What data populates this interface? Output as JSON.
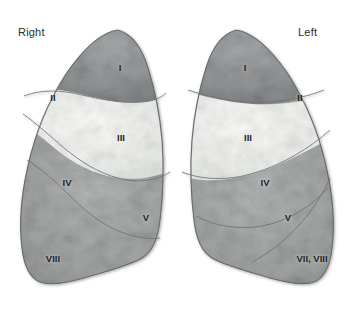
{
  "figure": {
    "width": 354,
    "height": 311,
    "background": "#ffffff"
  },
  "orientation_labels": {
    "right": "Right",
    "left": "Left"
  },
  "colors": {
    "background": "#ffffff",
    "lung_dark": "#8e9193",
    "lung_mid": "#9fa2a3",
    "lung_light": "#e6e8e6",
    "lung_pale": "#f0f1ef",
    "outline": "#6a6d6f",
    "label_text": "#1d1d1d",
    "side_label_text": "#2b2b2b"
  },
  "right_lung": {
    "name": "right-lung",
    "segments": [
      {
        "id": "r1",
        "label": "I",
        "x": 120,
        "y": 67,
        "shade": "dark"
      },
      {
        "id": "r2",
        "label": "II",
        "x": 53,
        "y": 97,
        "shade": "dark"
      },
      {
        "id": "r3",
        "label": "III",
        "x": 121,
        "y": 137,
        "shade": "light"
      },
      {
        "id": "r4",
        "label": "IV",
        "x": 67,
        "y": 182,
        "shade": "mid"
      },
      {
        "id": "r5",
        "label": "V",
        "x": 146,
        "y": 217,
        "shade": "mid"
      },
      {
        "id": "r8",
        "label": "VIII",
        "x": 53,
        "y": 258,
        "shade": "mid"
      }
    ]
  },
  "left_lung": {
    "name": "left-lung",
    "segments": [
      {
        "id": "l1",
        "label": "I",
        "x": 245,
        "y": 67,
        "shade": "dark"
      },
      {
        "id": "l2",
        "label": "II",
        "x": 300,
        "y": 97,
        "shade": "dark"
      },
      {
        "id": "l3",
        "label": "III",
        "x": 248,
        "y": 137,
        "shade": "light"
      },
      {
        "id": "l4",
        "label": "IV",
        "x": 265,
        "y": 182,
        "shade": "mid"
      },
      {
        "id": "l5",
        "label": "V",
        "x": 288,
        "y": 217,
        "shade": "mid"
      },
      {
        "id": "l78",
        "label": "VII, VIII",
        "x": 312,
        "y": 258,
        "shade": "mid"
      }
    ]
  }
}
